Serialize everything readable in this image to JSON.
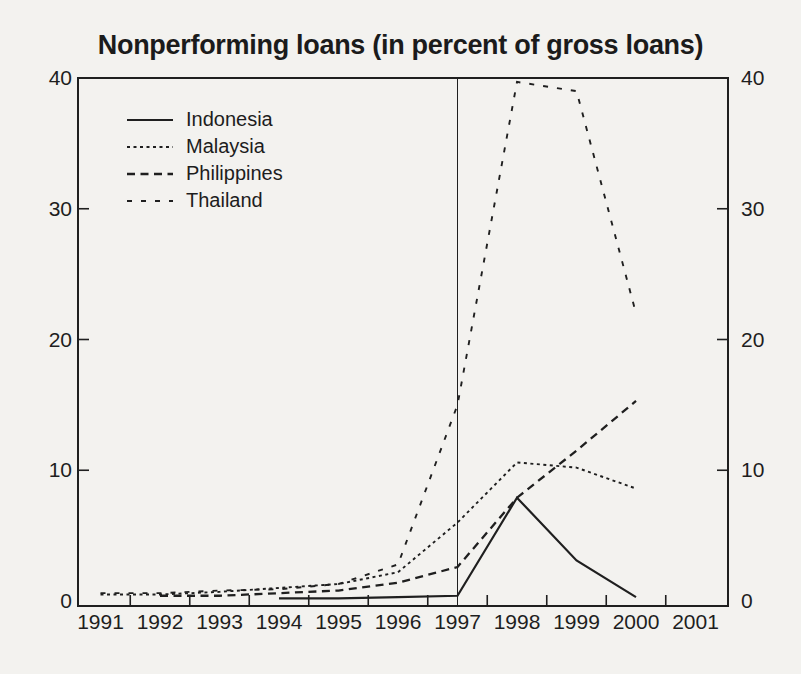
{
  "chart_data": {
    "type": "line",
    "title": "Nonperforming loans (in percent of gross loans)",
    "ylabel": "percent of gross loans",
    "ylim": [
      0,
      40
    ],
    "y_tick_labels": [
      "0",
      "10",
      "20",
      "30",
      "40"
    ],
    "y_axis_sides": "left and right",
    "x_labels": [
      "1991",
      "1992",
      "1993",
      "1994",
      "1995",
      "1996",
      "1997",
      "1998",
      "1999",
      "2000",
      "2001"
    ],
    "event_line_year": 1997,
    "legend_position": "top-left",
    "grid": "off",
    "ink_color": "#1f1f1f",
    "paper_color": "#f3f2ef",
    "series": [
      {
        "name": "Indonesia",
        "style": "solid",
        "dash": "",
        "width": 2.2,
        "values": [
          null,
          null,
          null,
          0.2,
          0.2,
          0.3,
          0.4,
          7.9,
          3.1,
          0.3,
          null
        ]
      },
      {
        "name": "Malaysia",
        "style": "fine-dashed",
        "dash": "3 3.5",
        "width": 1.9,
        "values": [
          0.5,
          0.5,
          0.7,
          1.0,
          1.3,
          2.2,
          6.0,
          10.6,
          10.2,
          8.6,
          null
        ]
      },
      {
        "name": "Philippines",
        "style": "dashed",
        "dash": "8 5.5",
        "width": 2.3,
        "values": [
          null,
          0.4,
          0.4,
          0.6,
          0.8,
          1.4,
          2.6,
          7.9,
          11.5,
          15.3,
          null
        ]
      },
      {
        "name": "Thailand",
        "style": "sparse-dashed",
        "dash": "5 9",
        "width": 1.9,
        "values": [
          0.6,
          0.6,
          0.8,
          0.9,
          1.3,
          2.8,
          15.0,
          39.7,
          39.0,
          22.0,
          null
        ]
      }
    ]
  }
}
